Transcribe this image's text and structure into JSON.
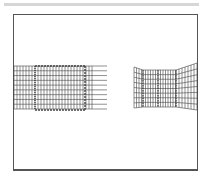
{
  "figure": {
    "colors": {
      "line": "#444444",
      "frame": "#555555",
      "bar": "#d6d6d6",
      "background": "#ffffff"
    },
    "left_mesh": {
      "x0": 14,
      "x1": 107,
      "y0": 66,
      "y1": 109,
      "rows": 9,
      "col_step": 3
    },
    "left_patch": {
      "x0": 35,
      "y0": 66,
      "x1": 85,
      "y1": 110
    },
    "right_mesh": {
      "left_flap": {
        "x0": 134,
        "x1": 143,
        "y0": 67,
        "y1": 108
      },
      "middle": {
        "x0": 143,
        "x1": 176,
        "y0": 70,
        "y1": 107
      },
      "right_flap": {
        "x0": 176,
        "x1": 197,
        "top_left": 70,
        "top_right": 63,
        "bottom_left": 107,
        "bottom_right": 110
      }
    }
  }
}
